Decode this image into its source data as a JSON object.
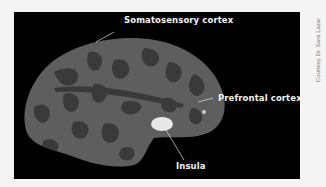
{
  "figure": {
    "labels": {
      "somatosensory": "Somatosensory cortex",
      "prefrontal": "Prefrontal cortex",
      "insula": "Insula"
    },
    "credit": "Courtesy Dr. Sara Lazar",
    "colors": {
      "background": "#000000",
      "cortex_light": "#5e5e5e",
      "cortex_dark": "#3a3a3a",
      "highlight": "#e8e8e8",
      "label_text": "#f2f2f2"
    }
  }
}
